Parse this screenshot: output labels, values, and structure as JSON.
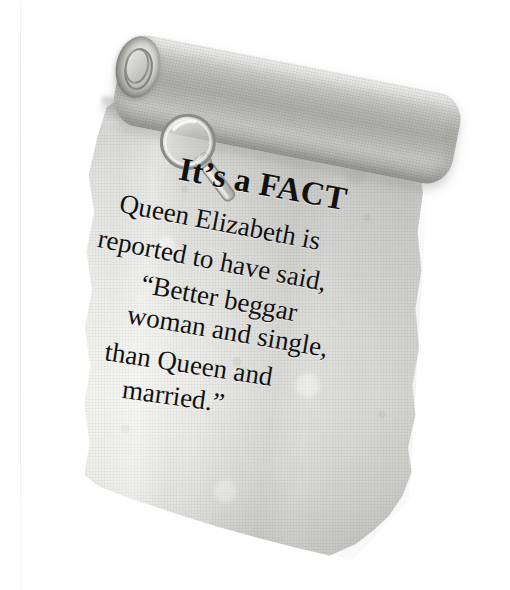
{
  "image": {
    "kind": "scanned-book-illustration",
    "subject": "parchment-scroll-fact-box",
    "background_color": "#ffffff"
  },
  "scroll": {
    "paper_color": "#e9e9e6",
    "paper_shadow_color": "#b4b4b1",
    "ink_color": "#111111",
    "roll_color": "#b4b4b1"
  },
  "icons": {
    "magnifier": "magnifying-glass-icon"
  },
  "content": {
    "headline": "It’s a FACT",
    "lines": [
      "Queen Elizabeth is",
      "reported to have said,",
      "“Better beggar",
      "woman and single,",
      "than Queen and",
      "married.”"
    ],
    "full_quote": "Queen Elizabeth is reported to have said, “Better beggar woman and single, than Queen and married.”"
  }
}
